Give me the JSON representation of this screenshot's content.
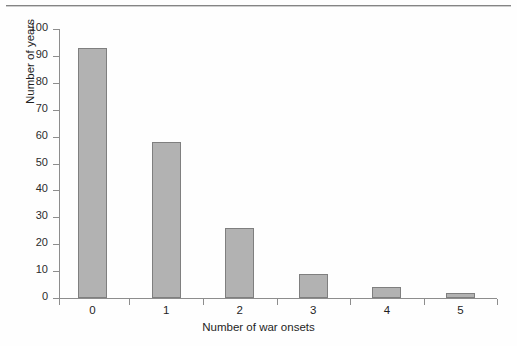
{
  "figure": {
    "background_color": "#fefefe",
    "scan_artifact": "top-edge-rule"
  },
  "chart_data": {
    "type": "bar",
    "title": "",
    "categories": [
      "0",
      "1",
      "2",
      "3",
      "4",
      "5"
    ],
    "values": [
      93,
      58,
      26,
      9,
      4,
      2
    ],
    "xlabel": "Number of war onsets",
    "ylabel": "Number of years",
    "ylim": [
      0,
      100
    ],
    "yticks": [
      0,
      10,
      20,
      30,
      40,
      50,
      60,
      70,
      80,
      90,
      100
    ],
    "ytick_labels": [
      "0",
      "10",
      "20",
      "30",
      "40",
      "50",
      "60",
      "70",
      "80",
      "90",
      "100"
    ],
    "xtick_labels": [
      "0",
      "1",
      "2",
      "3",
      "4",
      "5"
    ],
    "grid": false,
    "legend": null,
    "bar_fill_color": "#b2b2b2",
    "bar_edge_color": "#7f7f7f",
    "axis_color": "#8d8d8d",
    "text_color": "#1f1f1f"
  }
}
